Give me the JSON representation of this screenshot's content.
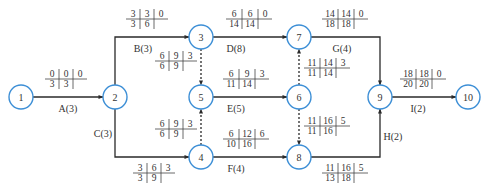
{
  "colors": {
    "node_stroke": "#3d8fd6",
    "edge": "#2a2a2a",
    "text": "#333333"
  },
  "nodes": [
    {
      "id": "1",
      "x": 21,
      "y": 97
    },
    {
      "id": "2",
      "x": 115,
      "y": 97
    },
    {
      "id": "3",
      "x": 201,
      "y": 37
    },
    {
      "id": "4",
      "x": 201,
      "y": 157
    },
    {
      "id": "5",
      "x": 201,
      "y": 97
    },
    {
      "id": "6",
      "x": 299,
      "y": 97
    },
    {
      "id": "7",
      "x": 299,
      "y": 37
    },
    {
      "id": "8",
      "x": 299,
      "y": 157
    },
    {
      "id": "9",
      "x": 380,
      "y": 97
    },
    {
      "id": "10",
      "x": 468,
      "y": 97
    }
  ],
  "activities": [
    {
      "label": "A(3)",
      "from": "1",
      "to": "2",
      "dummy": false,
      "path": "M33,97 L103,97",
      "label_pos": [
        68,
        112
      ],
      "table": {
        "x": 45,
        "y": 69,
        "top": [
          "0",
          "0",
          "0"
        ],
        "bottom": [
          "3",
          "3"
        ]
      }
    },
    {
      "label": "B(3)",
      "from": "2",
      "to": "3",
      "dummy": false,
      "path": "M115,85 L115,37 L189,37",
      "label_pos": [
        143,
        52
      ],
      "table": {
        "x": 126,
        "y": 9,
        "top": [
          "3",
          "3",
          "0"
        ],
        "bottom": [
          "3",
          "6"
        ]
      }
    },
    {
      "label": "C(3)",
      "from": "2",
      "to": "4",
      "dummy": false,
      "path": "M115,109 L115,157 L189,157",
      "label_pos": [
        103,
        137
      ],
      "table": {
        "x": 133,
        "y": 163,
        "top": [
          "3",
          "6",
          "3"
        ],
        "bottom": [
          "3",
          "9"
        ]
      }
    },
    {
      "label": "D(8)",
      "from": "3",
      "to": "7",
      "dummy": false,
      "path": "M213,37 L287,37",
      "label_pos": [
        236,
        52
      ],
      "table": {
        "x": 226,
        "y": 9,
        "top": [
          "6",
          "6",
          "0"
        ],
        "bottom": [
          "14",
          "14"
        ]
      }
    },
    {
      "label": "E(5)",
      "from": "5",
      "to": "6",
      "dummy": false,
      "path": "M213,97 L287,97",
      "label_pos": [
        236,
        112
      ],
      "table": {
        "x": 223,
        "y": 69,
        "top": [
          "6",
          "9",
          "3"
        ],
        "bottom": [
          "11",
          "14"
        ]
      }
    },
    {
      "label": "F(4)",
      "from": "4",
      "to": "8",
      "dummy": false,
      "path": "M213,157 L287,157",
      "label_pos": [
        236,
        172
      ],
      "table": {
        "x": 223,
        "y": 129,
        "top": [
          "6",
          "12",
          "6"
        ],
        "bottom": [
          "10",
          "16"
        ]
      }
    },
    {
      "label": "G(4)",
      "from": "7",
      "to": "9",
      "dummy": false,
      "path": "M311,37 L380,37 L380,85",
      "label_pos": [
        342,
        52
      ],
      "table": {
        "x": 322,
        "y": 9,
        "top": [
          "14",
          "14",
          "0"
        ],
        "bottom": [
          "18",
          "18"
        ]
      }
    },
    {
      "label": "H(2)",
      "from": "8",
      "to": "9",
      "dummy": false,
      "path": "M311,157 L380,157 L380,109",
      "label_pos": [
        393,
        140
      ],
      "table": {
        "x": 322,
        "y": 163,
        "top": [
          "11",
          "16",
          "5"
        ],
        "bottom": [
          "13",
          "18"
        ]
      }
    },
    {
      "label": "I(2)",
      "from": "9",
      "to": "10",
      "dummy": false,
      "path": "M392,97 L456,97",
      "label_pos": [
        418,
        112
      ],
      "table": {
        "x": 400,
        "y": 69,
        "top": [
          "18",
          "18",
          "0"
        ],
        "bottom": [
          "20",
          "20"
        ]
      }
    },
    {
      "label": "",
      "from": "3",
      "to": "5",
      "dummy": true,
      "path": "M201,49 L201,85",
      "label_pos": [
        0,
        0
      ],
      "table": {
        "x": 155,
        "y": 51,
        "top": [
          "6",
          "9",
          "3"
        ],
        "bottom": [
          "6",
          "9"
        ]
      }
    },
    {
      "label": "",
      "from": "4",
      "to": "5",
      "dummy": true,
      "path": "M201,145 L201,109",
      "label_pos": [
        0,
        0
      ],
      "table": {
        "x": 155,
        "y": 119,
        "top": [
          "6",
          "9",
          "3"
        ],
        "bottom": [
          "6",
          "9"
        ]
      }
    },
    {
      "label": "",
      "from": "6",
      "to": "7",
      "dummy": true,
      "path": "M299,85 L299,49",
      "label_pos": [
        0,
        0
      ],
      "table": {
        "x": 304,
        "y": 58,
        "top": [
          "11",
          "14",
          "3"
        ],
        "bottom": [
          "11",
          "14"
        ]
      }
    },
    {
      "label": "",
      "from": "6",
      "to": "8",
      "dummy": true,
      "path": "M299,109 L299,145",
      "label_pos": [
        0,
        0
      ],
      "table": {
        "x": 304,
        "y": 116,
        "top": [
          "11",
          "16",
          "5"
        ],
        "bottom": [
          "11",
          "16"
        ]
      }
    }
  ]
}
